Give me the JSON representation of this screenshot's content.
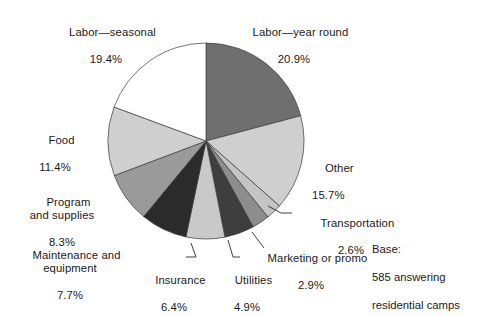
{
  "chart_data": {
    "type": "pie",
    "title": "",
    "subtitle": "",
    "legend": "none",
    "start_angle_deg": 0,
    "direction": "clockwise",
    "categories": [
      "Labor—year round",
      "Other",
      "Transportation",
      "Marketing or promo",
      "Utilities",
      "Insurance",
      "Maintenance and equipment",
      "Program and supplies",
      "Food",
      "Labor—seasonal"
    ],
    "values": [
      20.9,
      15.7,
      2.6,
      2.9,
      4.9,
      6.4,
      7.7,
      8.3,
      11.4,
      19.4
    ],
    "value_unit": "%",
    "colors": [
      "#6f6f6f",
      "#cfcfcf",
      "#c4c4c4",
      "#8d8d8d",
      "#3e3e3e",
      "#c9c9c9",
      "#2b2b2b",
      "#9a9a9a",
      "#cfcfcf",
      "#5c5c5c"
    ],
    "slices": [
      {
        "label": "Labor—year round",
        "value": 20.9,
        "value_text": "20.9%",
        "color": "#6f6f6f"
      },
      {
        "label": "Other",
        "value": 15.7,
        "value_text": "15.7%",
        "color": "#cfcfcf"
      },
      {
        "label": "Transportation",
        "value": 2.6,
        "value_text": "2.6%",
        "color": "#c4c4c4"
      },
      {
        "label": "Marketing or promo",
        "value": 2.9,
        "value_text": "2.9%",
        "color": "#8d8d8d"
      },
      {
        "label": "Utilities",
        "value": 4.9,
        "value_text": "4.9%",
        "color": "#3e3e3e"
      },
      {
        "label": "Insurance",
        "value": 6.4,
        "value_text": "6.4%",
        "color": "#c9c9c9"
      },
      {
        "label": "Maintenance and equipment",
        "value": 7.7,
        "value_text": "7.7%",
        "color": "#2b2b2b"
      },
      {
        "label": "Program and supplies",
        "value": 8.3,
        "value_text": "8.3%",
        "color": "#9a9a9a"
      },
      {
        "label": "Food",
        "value": 11.4,
        "value_text": "11.4%",
        "color": "#cfcfcf"
      },
      {
        "label": "Labor—seasonal",
        "value": 19.4,
        "value_text": "19.4%",
        "color": "#ffffff"
      }
    ],
    "total": 100.2,
    "base_note": "Base:\n585 answering\nresidential camps"
  },
  "labels": {
    "labor_seasonal": {
      "name": "Labor—seasonal",
      "value": "19.4%"
    },
    "labor_year": {
      "name": "Labor—year round",
      "value": "20.9%"
    },
    "other": {
      "name": "Other",
      "value": "15.7%"
    },
    "food": {
      "name": "Food",
      "value": "11.4%"
    },
    "program": {
      "name": "Program\nand supplies",
      "value": "8.3%"
    },
    "maintenance": {
      "name": "Maintenance and\nequipment",
      "value": "7.7%"
    },
    "insurance": {
      "name": "Insurance",
      "value": "6.4%"
    },
    "utilities": {
      "name": "Utilities",
      "value": "4.9%"
    },
    "marketing": {
      "name": "Marketing or promo",
      "value": "2.9%"
    },
    "transportation": {
      "name": "Transportation",
      "value": "2.6%"
    }
  },
  "base": {
    "line1": "Base:",
    "line2": "585 answering",
    "line3": "residential camps"
  }
}
